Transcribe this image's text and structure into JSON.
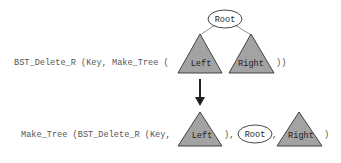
{
  "diagram": {
    "top": {
      "prefix": "BST_Delete_R (Key, Make_Tree (",
      "suffix": "))",
      "root_label": "Root",
      "left_label": "Left",
      "right_label": "Right"
    },
    "arrow": {
      "direction": "down"
    },
    "bottom": {
      "prefix": "Make_Tree (BST_Delete_R (Key,",
      "sep1": "),",
      "sep2": ",",
      "suffix": ")",
      "left_label": "Left",
      "root_label": "Root",
      "right_label": "Right"
    },
    "colors": {
      "triangle_fill": "#a3a3a3",
      "triangle_stroke": "#333333",
      "ellipse_stroke": "#333333",
      "text": "#555555",
      "arrow": "#222222"
    }
  }
}
